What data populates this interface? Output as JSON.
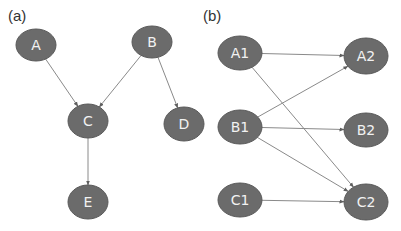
{
  "panels": {
    "a": {
      "label": "(a)",
      "nodes": [
        {
          "id": "A",
          "label": "A",
          "cx": 36,
          "cy": 45,
          "rx": 20,
          "ry": 16
        },
        {
          "id": "B",
          "label": "B",
          "cx": 152,
          "cy": 42,
          "rx": 20,
          "ry": 16
        },
        {
          "id": "C",
          "label": "C",
          "cx": 88,
          "cy": 121,
          "rx": 20,
          "ry": 17
        },
        {
          "id": "D",
          "label": "D",
          "cx": 184,
          "cy": 124,
          "rx": 20,
          "ry": 17
        },
        {
          "id": "E",
          "label": "E",
          "cx": 88,
          "cy": 202,
          "rx": 20,
          "ry": 17
        }
      ],
      "edges": [
        {
          "from": "A",
          "to": "C"
        },
        {
          "from": "B",
          "to": "C"
        },
        {
          "from": "B",
          "to": "D"
        },
        {
          "from": "C",
          "to": "E"
        }
      ]
    },
    "b": {
      "label": "(b)",
      "nodes": [
        {
          "id": "A1",
          "label": "A1",
          "cx": 240,
          "cy": 53,
          "rx": 22,
          "ry": 17
        },
        {
          "id": "A2",
          "label": "A2",
          "cx": 366,
          "cy": 56,
          "rx": 22,
          "ry": 18
        },
        {
          "id": "B1",
          "label": "B1",
          "cx": 240,
          "cy": 127,
          "rx": 22,
          "ry": 17
        },
        {
          "id": "B2",
          "label": "B2",
          "cx": 366,
          "cy": 130,
          "rx": 22,
          "ry": 17
        },
        {
          "id": "C1",
          "label": "C1",
          "cx": 240,
          "cy": 200,
          "rx": 22,
          "ry": 17
        },
        {
          "id": "C2",
          "label": "C2",
          "cx": 366,
          "cy": 202,
          "rx": 22,
          "ry": 18
        }
      ],
      "edges": [
        {
          "from": "A1",
          "to": "A2"
        },
        {
          "from": "A1",
          "to": "C2"
        },
        {
          "from": "B1",
          "to": "A2"
        },
        {
          "from": "B1",
          "to": "B2"
        },
        {
          "from": "B1",
          "to": "C2"
        },
        {
          "from": "C1",
          "to": "C2"
        }
      ]
    }
  },
  "style": {
    "node_fill": "#6b6b6b",
    "node_stroke": "#5a5a5a",
    "edge_color": "#8a8a8a",
    "arrow_color": "#5f5f5f",
    "label_color": "#f2f2f2"
  }
}
